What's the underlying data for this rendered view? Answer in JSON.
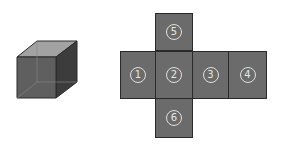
{
  "cube": {
    "label": "3D cube",
    "colors": {
      "front": "#5e5e5e",
      "top": "#9a9a9a",
      "side": "#3a3a3a"
    }
  },
  "net": {
    "faces": [
      {
        "id": "face-5",
        "label": "5",
        "x": 155,
        "y": 13,
        "w": 38,
        "h": 38
      },
      {
        "id": "face-1",
        "label": "1",
        "x": 120,
        "y": 51,
        "w": 36,
        "h": 48
      },
      {
        "id": "face-2",
        "label": "2",
        "x": 155,
        "y": 51,
        "w": 38,
        "h": 48
      },
      {
        "id": "face-3",
        "label": "3",
        "x": 192,
        "y": 51,
        "w": 37,
        "h": 48
      },
      {
        "id": "face-4",
        "label": "4",
        "x": 228,
        "y": 51,
        "w": 39,
        "h": 48
      },
      {
        "id": "face-6",
        "label": "6",
        "x": 155,
        "y": 98,
        "w": 38,
        "h": 40
      }
    ],
    "face_color": "#6b6b6b"
  }
}
